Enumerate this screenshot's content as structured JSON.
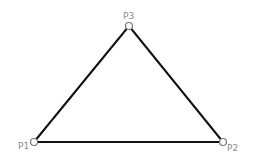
{
  "diagram": {
    "type": "triangle",
    "points": [
      {
        "id": "P1",
        "label": "P1",
        "x": 34,
        "y": 142,
        "label_x": 18,
        "label_y": 149
      },
      {
        "id": "P2",
        "label": "P2",
        "x": 223,
        "y": 142,
        "label_x": 227,
        "label_y": 151
      },
      {
        "id": "P3",
        "label": "P3",
        "x": 129,
        "y": 26,
        "label_x": 123,
        "label_y": 19
      }
    ],
    "edges": [
      {
        "from": "P1",
        "to": "P2"
      },
      {
        "from": "P2",
        "to": "P3"
      },
      {
        "from": "P3",
        "to": "P1"
      }
    ],
    "colors": {
      "edge": "#111111",
      "vertex_stroke": "#777777",
      "vertex_fill": "#ffffff",
      "label": "#8a8a8a"
    }
  }
}
